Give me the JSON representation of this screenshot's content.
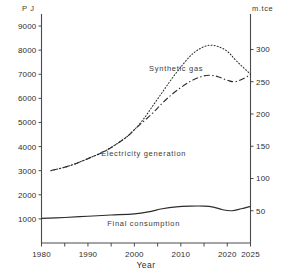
{
  "chart_data": {
    "type": "line",
    "title": "",
    "xlabel": "Year",
    "ylabel": "PJ",
    "ylabel_right": "m.tce",
    "xlim": [
      1980,
      2025
    ],
    "ylim": [
      0,
      9500
    ],
    "ylim_right": [
      0,
      355
    ],
    "grid": false,
    "legend": "inline-annotations",
    "xticks": [
      1980,
      1990,
      2000,
      2010,
      2020,
      2025
    ],
    "xtick_labels": [
      "1980",
      "1990",
      "2000",
      "2010",
      "2020",
      "2025"
    ],
    "yticks": [
      1000,
      2000,
      3000,
      4000,
      5000,
      6000,
      7000,
      8000,
      9000
    ],
    "ytick_labels": [
      "1000",
      "2000",
      "3000",
      "4000",
      "5000",
      "6000",
      "7000",
      "8000",
      "9000"
    ],
    "yticks_right": [
      50,
      100,
      150,
      200,
      250,
      300
    ],
    "ytick_labels_right": [
      "50",
      "100",
      "150",
      "200",
      "250",
      "300"
    ],
    "series": [
      {
        "name": "Synthetic gas",
        "style": "dotted",
        "x": [
          1982,
          1986,
          1990,
          1994,
          1998,
          2000,
          2002,
          2004,
          2006,
          2008,
          2010,
          2012,
          2014,
          2016,
          2018,
          2020,
          2022,
          2025
        ],
        "values": [
          3000,
          3200,
          3500,
          3850,
          4350,
          4700,
          5150,
          5700,
          6250,
          6800,
          7300,
          7750,
          8050,
          8200,
          8150,
          7950,
          7550,
          7000
        ]
      },
      {
        "name": "Electricity generation",
        "style": "dash-dot",
        "x": [
          1982,
          1986,
          1990,
          1994,
          1998,
          2000,
          2002,
          2004,
          2006,
          2008,
          2010,
          2012,
          2014,
          2016,
          2018,
          2020,
          2022,
          2025
        ],
        "values": [
          3000,
          3200,
          3500,
          3850,
          4350,
          4700,
          5050,
          5400,
          5800,
          6150,
          6450,
          6700,
          6880,
          6960,
          6900,
          6750,
          6700,
          6980
        ]
      },
      {
        "name": "Final consumption",
        "style": "solid",
        "x": [
          1980,
          1985,
          1990,
          1995,
          2000,
          2003,
          2006,
          2009,
          2012,
          2015,
          2017,
          2019,
          2021,
          2023,
          2025
        ],
        "values": [
          1020,
          1060,
          1110,
          1160,
          1210,
          1290,
          1420,
          1500,
          1530,
          1530,
          1490,
          1380,
          1340,
          1420,
          1520
        ]
      }
    ],
    "annotations": [
      {
        "text": "Synthetic gas",
        "x": 2009,
        "y": 7150
      },
      {
        "text": "Electricity generation",
        "x": 2002,
        "y": 3600
      },
      {
        "text": "Final consumption",
        "x": 2002,
        "y": 700
      }
    ]
  },
  "axes": {
    "left_unit": "P J",
    "right_unit": "m.tce",
    "x_title": "Year"
  }
}
